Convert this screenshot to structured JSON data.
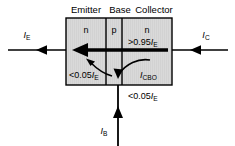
{
  "diagram": {
    "type": "npn-bipolar-transistor-current-flow",
    "regions": [
      {
        "name": "emitter",
        "heading": "Emitter",
        "doping": "n"
      },
      {
        "name": "base",
        "heading": "Base",
        "doping": "p"
      },
      {
        "name": "collector",
        "heading": "Collector",
        "doping": "n"
      }
    ],
    "terminals": [
      {
        "name": "emitter-terminal",
        "label_main": "I",
        "label_sub": "E",
        "direction": "left"
      },
      {
        "name": "collector-terminal",
        "label_main": "I",
        "label_sub": "C",
        "direction": "left"
      },
      {
        "name": "base-terminal",
        "label_main": "I",
        "label_sub": "B",
        "direction": "up"
      }
    ],
    "annotations": {
      "collector_current": {
        "prefix": ">0.95",
        "symbol": "I",
        "sub": "E"
      },
      "recombination_current": {
        "prefix": "<0.05",
        "symbol": "I",
        "sub": "E"
      },
      "base_current": {
        "prefix": "<0.05",
        "symbol": "I",
        "sub": "E"
      },
      "leakage_current": {
        "symbol": "I",
        "sub": "CBO"
      }
    },
    "colors": {
      "body_fill": "#d9d9d9",
      "stroke": "#000000",
      "background": "#ffffff"
    }
  }
}
